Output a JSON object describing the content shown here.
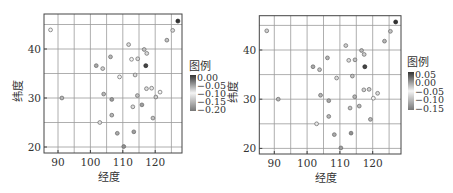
{
  "chart_data": [
    {
      "type": "scatter",
      "title": "",
      "xlabel": "经度",
      "ylabel": "纬度",
      "xlim": [
        85.7,
        128.3
      ],
      "ylim": [
        18.8,
        47.1
      ],
      "xticks": [
        "90",
        "100",
        "110",
        "120"
      ],
      "yticks": [
        "20",
        "30",
        "40"
      ],
      "grid": true,
      "grid_minor_step": 5,
      "legend": {
        "title": "图例",
        "position": "right",
        "type": "colorbar",
        "ticks": [
          "0.00",
          "-0.05",
          "-0.10",
          "-0.15",
          "-0.20"
        ],
        "range": [
          -0.2,
          0.0
        ]
      },
      "points": [
        {
          "lon": 87.7,
          "lat": 43.9,
          "value": -0.1
        },
        {
          "lon": 127.0,
          "lat": 45.7,
          "value": 0.0
        },
        {
          "lon": 125.4,
          "lat": 43.8,
          "value": -0.12
        },
        {
          "lon": 123.6,
          "lat": 41.8,
          "value": -0.14
        },
        {
          "lon": 111.8,
          "lat": 40.9,
          "value": -0.12
        },
        {
          "lon": 116.6,
          "lat": 39.9,
          "value": -0.14
        },
        {
          "lon": 117.4,
          "lat": 39.1,
          "value": -0.12
        },
        {
          "lon": 106.2,
          "lat": 38.4,
          "value": -0.15
        },
        {
          "lon": 112.7,
          "lat": 37.9,
          "value": -0.1
        },
        {
          "lon": 114.6,
          "lat": 38.0,
          "value": -0.12
        },
        {
          "lon": 117.1,
          "lat": 36.6,
          "value": -0.01
        },
        {
          "lon": 101.8,
          "lat": 36.6,
          "value": -0.16
        },
        {
          "lon": 103.8,
          "lat": 36.0,
          "value": -0.13
        },
        {
          "lon": 109.0,
          "lat": 34.3,
          "value": -0.1
        },
        {
          "lon": 113.8,
          "lat": 34.7,
          "value": -0.12
        },
        {
          "lon": 117.3,
          "lat": 31.9,
          "value": -0.12
        },
        {
          "lon": 118.9,
          "lat": 32.0,
          "value": -0.11
        },
        {
          "lon": 121.5,
          "lat": 31.2,
          "value": -0.1
        },
        {
          "lon": 114.5,
          "lat": 30.5,
          "value": -0.14
        },
        {
          "lon": 120.2,
          "lat": 30.2,
          "value": -0.08
        },
        {
          "lon": 104.1,
          "lat": 30.8,
          "value": -0.15
        },
        {
          "lon": 106.6,
          "lat": 29.7,
          "value": -0.17
        },
        {
          "lon": 91.2,
          "lat": 30.0,
          "value": -0.15
        },
        {
          "lon": 113.1,
          "lat": 28.2,
          "value": -0.12
        },
        {
          "lon": 115.9,
          "lat": 28.6,
          "value": -0.17
        },
        {
          "lon": 106.6,
          "lat": 26.5,
          "value": -0.15
        },
        {
          "lon": 119.3,
          "lat": 25.9,
          "value": -0.14
        },
        {
          "lon": 102.9,
          "lat": 25.0,
          "value": -0.09
        },
        {
          "lon": 108.3,
          "lat": 22.8,
          "value": -0.16
        },
        {
          "lon": 113.4,
          "lat": 23.1,
          "value": -0.17
        },
        {
          "lon": 110.3,
          "lat": 20.1,
          "value": -0.18
        }
      ]
    },
    {
      "type": "scatter",
      "title": "",
      "xlabel": "经度",
      "ylabel": "纬度",
      "xlim": [
        85.7,
        128.3
      ],
      "ylim": [
        18.8,
        47.1
      ],
      "xticks": [
        "90",
        "100",
        "110",
        "120"
      ],
      "yticks": [
        "20",
        "30",
        "40"
      ],
      "grid": true,
      "grid_minor_step": 5,
      "legend": {
        "title": "图例",
        "position": "right",
        "type": "colorbar",
        "ticks": [
          "0.05",
          "0.00",
          "-0.05",
          "-0.10",
          "-0.15"
        ],
        "range": [
          -0.15,
          0.05
        ]
      },
      "points": [
        {
          "lon": 87.7,
          "lat": 43.9,
          "value": -0.08
        },
        {
          "lon": 127.0,
          "lat": 45.7,
          "value": 0.05
        },
        {
          "lon": 125.4,
          "lat": 43.8,
          "value": -0.09
        },
        {
          "lon": 123.6,
          "lat": 41.8,
          "value": -0.1
        },
        {
          "lon": 111.8,
          "lat": 40.9,
          "value": -0.08
        },
        {
          "lon": 116.6,
          "lat": 39.9,
          "value": -0.1
        },
        {
          "lon": 117.4,
          "lat": 39.1,
          "value": -0.08
        },
        {
          "lon": 106.2,
          "lat": 38.4,
          "value": -0.1
        },
        {
          "lon": 112.7,
          "lat": 37.9,
          "value": -0.07
        },
        {
          "lon": 114.6,
          "lat": 38.0,
          "value": -0.09
        },
        {
          "lon": 117.6,
          "lat": 36.6,
          "value": 0.04
        },
        {
          "lon": 101.8,
          "lat": 36.6,
          "value": -0.11
        },
        {
          "lon": 103.8,
          "lat": 36.0,
          "value": -0.09
        },
        {
          "lon": 109.0,
          "lat": 34.3,
          "value": -0.07
        },
        {
          "lon": 113.8,
          "lat": 34.7,
          "value": -0.09
        },
        {
          "lon": 117.3,
          "lat": 31.9,
          "value": -0.08
        },
        {
          "lon": 118.9,
          "lat": 32.0,
          "value": -0.08
        },
        {
          "lon": 121.5,
          "lat": 31.2,
          "value": -0.07
        },
        {
          "lon": 114.5,
          "lat": 30.5,
          "value": -0.1
        },
        {
          "lon": 120.2,
          "lat": 30.2,
          "value": -0.05
        },
        {
          "lon": 104.1,
          "lat": 30.8,
          "value": -0.1
        },
        {
          "lon": 106.6,
          "lat": 29.7,
          "value": -0.11
        },
        {
          "lon": 91.2,
          "lat": 30.0,
          "value": -0.1
        },
        {
          "lon": 113.1,
          "lat": 28.2,
          "value": -0.09
        },
        {
          "lon": 115.9,
          "lat": 28.6,
          "value": -0.1
        },
        {
          "lon": 106.6,
          "lat": 26.5,
          "value": -0.1
        },
        {
          "lon": 119.3,
          "lat": 25.9,
          "value": -0.1
        },
        {
          "lon": 102.9,
          "lat": 25.0,
          "value": -0.06
        },
        {
          "lon": 108.3,
          "lat": 22.8,
          "value": -0.11
        },
        {
          "lon": 113.4,
          "lat": 23.1,
          "value": -0.13
        },
        {
          "lon": 110.3,
          "lat": 20.1,
          "value": -0.12
        }
      ]
    }
  ]
}
